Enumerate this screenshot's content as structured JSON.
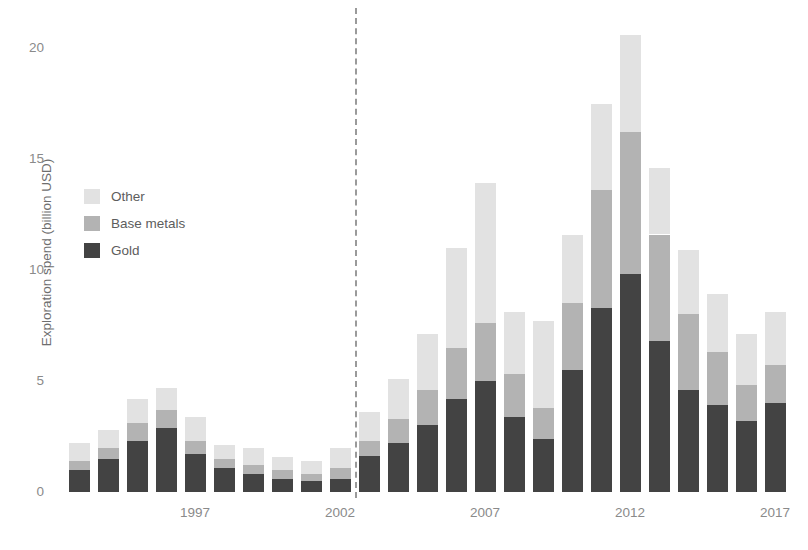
{
  "chart_data": {
    "type": "bar",
    "subtype": "stacked",
    "title": "",
    "xlabel": "",
    "ylabel": "Exploration spend (billion USD)",
    "ylim": [
      0,
      21
    ],
    "yticks": [
      0,
      5,
      10,
      15,
      20
    ],
    "ytick_labels": [
      "0",
      "5",
      "10",
      "15",
      "20"
    ],
    "xtick_labels": [
      "1997",
      "2002",
      "2007",
      "2012",
      "2017"
    ],
    "xtick_years": [
      1997,
      2002,
      2007,
      2012,
      2017
    ],
    "grid": false,
    "legend_position": "upper left",
    "categories": [
      1993,
      1994,
      1995,
      1996,
      1997,
      1998,
      1999,
      2000,
      2001,
      2002,
      2003,
      2004,
      2005,
      2006,
      2007,
      2008,
      2009,
      2010,
      2011,
      2012,
      2013,
      2014,
      2015,
      2016,
      2017
    ],
    "series": [
      {
        "name": "Gold",
        "color": "#434343",
        "values": [
          1.0,
          1.5,
          2.3,
          2.9,
          1.7,
          1.1,
          0.8,
          0.6,
          0.5,
          0.6,
          1.6,
          2.2,
          3.0,
          4.2,
          5.0,
          3.4,
          2.4,
          5.5,
          8.3,
          9.8,
          6.8,
          4.6,
          3.9,
          3.2,
          4.0
        ]
      },
      {
        "name": "Base metals",
        "color": "#b3b3b3",
        "values": [
          0.4,
          0.5,
          0.8,
          0.8,
          0.6,
          0.4,
          0.4,
          0.4,
          0.3,
          0.5,
          0.7,
          1.1,
          1.6,
          2.3,
          2.6,
          1.9,
          1.4,
          3.0,
          5.3,
          6.4,
          4.8,
          3.4,
          2.4,
          1.6,
          1.7
        ]
      },
      {
        "name": "Other",
        "color": "#e2e2e2",
        "values": [
          0.8,
          0.8,
          1.1,
          1.0,
          1.1,
          0.6,
          0.8,
          0.6,
          0.6,
          0.9,
          1.3,
          1.8,
          2.5,
          4.5,
          6.3,
          2.8,
          3.9,
          3.1,
          3.9,
          4.4,
          3.0,
          2.9,
          2.6,
          2.3,
          2.4
        ]
      }
    ],
    "totals": [
      2.2,
      2.8,
      4.2,
      4.7,
      3.4,
      2.1,
      2.0,
      1.6,
      1.4,
      2.0,
      3.6,
      5.1,
      7.1,
      11.0,
      13.9,
      8.1,
      7.7,
      11.6,
      17.5,
      20.6,
      14.6,
      10.9,
      8.9,
      7.1,
      8.1
    ],
    "annotations": [
      {
        "type": "vertical-dashed-line",
        "at_x": 2002.5,
        "label": ""
      }
    ]
  },
  "legend": {
    "items": [
      {
        "label": "Other",
        "color": "#e2e2e2"
      },
      {
        "label": "Base metals",
        "color": "#b3b3b3"
      },
      {
        "label": "Gold",
        "color": "#434343"
      }
    ]
  }
}
